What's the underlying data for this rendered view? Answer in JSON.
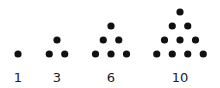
{
  "dot_color": "#111111",
  "figures": [
    {
      "label": "1",
      "rows": [
        1
      ]
    },
    {
      "label": "3",
      "rows": [
        1,
        2
      ]
    },
    {
      "label": "6",
      "rows": [
        1,
        2,
        3
      ]
    },
    {
      "label": "10",
      "rows": [
        1,
        2,
        3,
        4
      ]
    }
  ]
}
